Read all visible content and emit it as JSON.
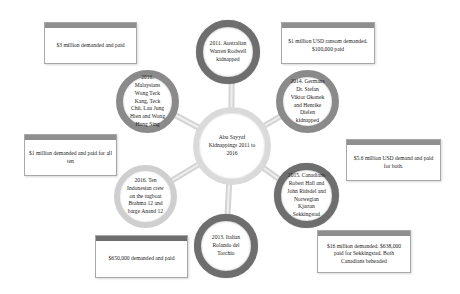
{
  "center": {
    "label": "Abu Sayyaf Kidnappings 2011 to 2016"
  },
  "nodes": [
    {
      "id": "2011",
      "label": "2011. Australian Warren Rodwell kidnapped"
    },
    {
      "id": "2014-german",
      "label": "2014. Germans Dr. Stefan Viktor Okonek and Henrike Dielen kidnapped"
    },
    {
      "id": "2015-canadian",
      "label": "2015. Canadians Robert Hall and John Ridsdel and Norwegian Kjartan Sekkingstad"
    },
    {
      "id": "2013",
      "label": "2013. Italian Rolando del Torchio"
    },
    {
      "id": "2016-indonesian",
      "label": "2016. Ten Indonesian crew on the tugboat Brahma 12 and barge Anand 12"
    },
    {
      "id": "2016-malaysian",
      "label": "2016. Malaysians Wong Teck Kang, Teck Chii, Lau Jung Hien and Wong Hung Sing"
    }
  ],
  "boxes": [
    {
      "id": "ransom-malaysians",
      "text": "$3 million demanded and paid"
    },
    {
      "id": "ransom-rodwell",
      "text": "$1 million USD ransom demanded. $100,000 paid"
    },
    {
      "id": "ransom-germans",
      "text": "$5.6 million USD demand and paid for both."
    },
    {
      "id": "ransom-canadians",
      "text": "$16 million demanded. $638,000 paid for Sekkingstad. Both Canadians beheaded"
    },
    {
      "id": "ransom-italian",
      "text": "$650,000 demanded and paid"
    },
    {
      "id": "ransom-indonesians",
      "text": "$1 million demanded and paid for all ten"
    }
  ],
  "colors": {
    "ring_dark": "#6e6e6e",
    "ring_mid": "#8a8a8a",
    "ring_light": "#cfcfcf",
    "box_bar": "#8f8f8f",
    "box_border": "#a8a8a8"
  }
}
